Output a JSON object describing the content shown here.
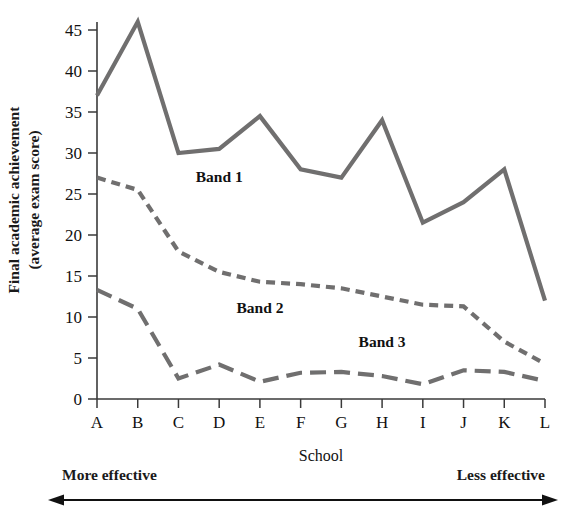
{
  "chart_data": {
    "type": "line",
    "title": "",
    "xlabel": "School",
    "ylabel": "Final academic achievement (average exam score)",
    "ylabel_line1": "Final academic achievement",
    "ylabel_line2": "(average exam score)",
    "categories": [
      "A",
      "B",
      "C",
      "D",
      "E",
      "F",
      "G",
      "H",
      "I",
      "J",
      "K",
      "L"
    ],
    "ylim": [
      0,
      47
    ],
    "yticks": [
      0,
      5,
      10,
      15,
      20,
      25,
      30,
      35,
      40,
      45
    ],
    "grid": false,
    "legend_position": "inline-annotations",
    "series": [
      {
        "name": "Band 1",
        "style": "solid",
        "color": "#706f6f",
        "values": [
          37,
          46,
          30,
          30.5,
          34.5,
          28,
          27,
          34,
          21.5,
          24,
          28,
          12
        ]
      },
      {
        "name": "Band 2",
        "style": "dotted",
        "color": "#706f6f",
        "values": [
          27,
          25.5,
          18,
          15.5,
          14.3,
          14,
          13.5,
          12.5,
          11.5,
          11.3,
          7,
          4.3
        ]
      },
      {
        "name": "Band 3",
        "style": "dashed",
        "color": "#706f6f",
        "values": [
          13.3,
          11,
          2.5,
          4.2,
          2.1,
          3.2,
          3.3,
          2.8,
          1.8,
          3.5,
          3.3,
          2.2
        ]
      }
    ],
    "annotations": [
      {
        "text": "Band 1",
        "x_category": "D",
        "y_value": 26.5
      },
      {
        "text": "Band 2",
        "x_category": "E",
        "y_value": 10.5
      },
      {
        "text": "Band 3",
        "x_category": "H",
        "y_value": 6.4
      }
    ]
  },
  "bottom_annotation": {
    "left_label": "More effective",
    "right_label": "Less effective",
    "arrow": "double-headed-horizontal-arrow"
  },
  "colors": {
    "series": "#706f6f",
    "axis": "#3a3a3a",
    "text": "#111111",
    "background": "#ffffff"
  }
}
